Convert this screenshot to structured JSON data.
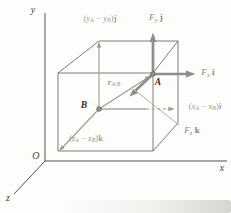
{
  "figure": {
    "type": "3d-cartesian-vector-diagram",
    "colors": {
      "line": "#5d5a55",
      "component_accent": "#a09a90",
      "force_accent": "#8e8e8c",
      "label_dark": "#3c3a37",
      "background": "#fdfdfb"
    },
    "axes": {
      "x": "x",
      "y": "y",
      "z": "z",
      "origin": "O"
    },
    "points": {
      "a": "A",
      "b": "B"
    },
    "labels": {
      "force_y": {
        "parts": [
          {
            "t": "F",
            "k": "i"
          },
          {
            "t": "y",
            "k": "s"
          },
          {
            "t": " j",
            "k": "b"
          }
        ]
      },
      "force_x": {
        "parts": [
          {
            "t": "F",
            "k": "i"
          },
          {
            "t": "x",
            "k": "s"
          },
          {
            "t": " i",
            "k": "b"
          }
        ]
      },
      "force_z": {
        "parts": [
          {
            "t": "F",
            "k": "i"
          },
          {
            "t": "z",
            "k": "s"
          },
          {
            "t": " k",
            "k": "b"
          }
        ]
      },
      "position_vector": {
        "parts": [
          {
            "t": "r",
            "k": "b"
          },
          {
            "t": "A/B",
            "k": "s"
          }
        ]
      },
      "comp_y": {
        "parts": [
          {
            "t": "(",
            "k": "n"
          },
          {
            "t": "y",
            "k": "i"
          },
          {
            "t": "A",
            "k": "s"
          },
          {
            "t": " − ",
            "k": "n"
          },
          {
            "t": "y",
            "k": "i"
          },
          {
            "t": "B",
            "k": "s"
          },
          {
            "t": ")",
            "k": "n"
          },
          {
            "t": "j",
            "k": "b"
          }
        ]
      },
      "comp_x": {
        "parts": [
          {
            "t": "(",
            "k": "n"
          },
          {
            "t": "x",
            "k": "i"
          },
          {
            "t": "A",
            "k": "s"
          },
          {
            "t": " − ",
            "k": "n"
          },
          {
            "t": "x",
            "k": "i"
          },
          {
            "t": "B",
            "k": "s"
          },
          {
            "t": ")",
            "k": "n"
          },
          {
            "t": "i",
            "k": "b"
          }
        ]
      },
      "comp_z": {
        "parts": [
          {
            "t": "(",
            "k": "n"
          },
          {
            "t": "z",
            "k": "i"
          },
          {
            "t": "A",
            "k": "s"
          },
          {
            "t": " − ",
            "k": "n"
          },
          {
            "t": "z",
            "k": "i"
          },
          {
            "t": "B",
            "k": "s"
          },
          {
            "t": ")",
            "k": "n"
          },
          {
            "t": "k",
            "k": "b"
          }
        ]
      }
    }
  }
}
